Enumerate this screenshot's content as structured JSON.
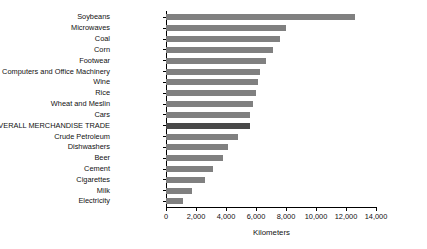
{
  "chart_data": {
    "type": "bar",
    "orientation": "horizontal",
    "title": "",
    "xlabel": "Kilometers",
    "ylabel": "",
    "xlim": [
      0,
      14000
    ],
    "xticks": [
      0,
      2000,
      4000,
      6000,
      8000,
      10000,
      12000,
      14000
    ],
    "xtick_labels": [
      "0",
      "2,000",
      "4,000",
      "6,000",
      "8,000",
      "10,000",
      "12,000",
      "14,000"
    ],
    "grid": false,
    "legend": false,
    "bar_color": "#808080",
    "highlight_color": "#494949",
    "highlight_category": "OVERALL MERCHANDISE TRADE",
    "categories": [
      "Soybeans",
      "Microwaves",
      "Coal",
      "Corn",
      "Footwear",
      "Computers and Office Machinery",
      "Wine",
      "Rice",
      "Wheat and Meslin",
      "Cars",
      "OVERALL MERCHANDISE TRADE",
      "Crude Petroleum",
      "Dishwashers",
      "Beer",
      "Cement",
      "Cigarettes",
      "Milk",
      "Electricity"
    ],
    "values": [
      12600,
      8000,
      7600,
      7100,
      6650,
      6250,
      6100,
      6000,
      5800,
      5600,
      5600,
      4800,
      4100,
      3800,
      3100,
      2600,
      1700,
      1100
    ]
  }
}
